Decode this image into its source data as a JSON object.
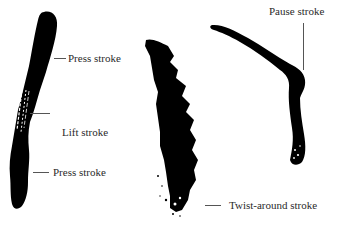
{
  "diagram": {
    "background": "#ffffff",
    "ink_color": "#000000",
    "strokes": [
      {
        "id": "stroke-1",
        "description": "Vertical brush stroke: press, lift, press"
      },
      {
        "id": "stroke-2",
        "description": "Jagged vertical brush stroke with twist-around end"
      },
      {
        "id": "stroke-3",
        "description": "Curved brush stroke with pause"
      }
    ],
    "labels": {
      "press_top": "Press stroke",
      "lift": "Lift stroke",
      "press_bottom": "Press stroke",
      "twist_around": "Twist-around stroke",
      "pause": "Pause stroke"
    }
  }
}
